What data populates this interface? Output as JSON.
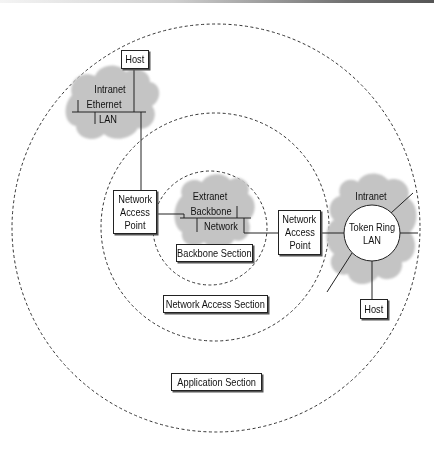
{
  "diagram": {
    "sections": {
      "application": "Application Section",
      "network_access": "Network Access Section",
      "backbone": "Backbone Section"
    },
    "left_lan": {
      "cloud_label": "Intranet",
      "lan_line1": "Ethernet",
      "lan_line2": "LAN",
      "host": "Host"
    },
    "backbone": {
      "cloud_label": "Extranet",
      "line1": "Backbone",
      "line2": "Network"
    },
    "left_nap": {
      "line1": "Network",
      "line2": "Access",
      "line3": "Point"
    },
    "right_nap": {
      "line1": "Network",
      "line2": "Access",
      "line3": "Point"
    },
    "right_lan": {
      "cloud_label": "Intranet",
      "ring_line1": "Token Ring",
      "ring_line2": "LAN",
      "host": "Host"
    },
    "colors": {
      "cloud": "#c4c4c4",
      "line": "#222222",
      "dashed_ring": "#333333",
      "background": "#ffffff"
    }
  }
}
